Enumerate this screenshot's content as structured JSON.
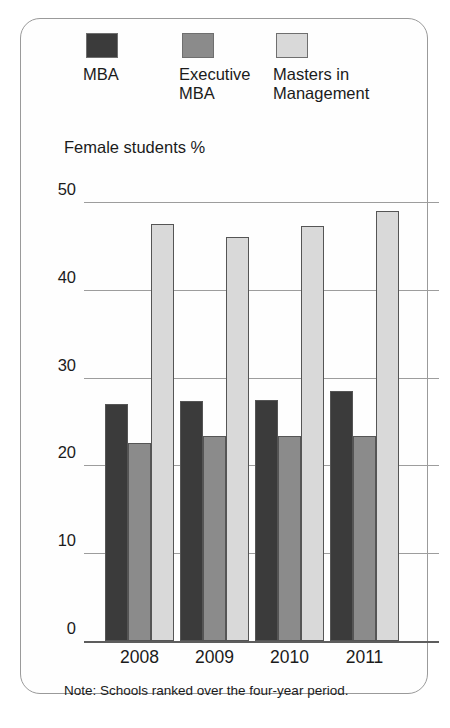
{
  "chart_data": {
    "type": "bar",
    "title": "",
    "subtitle": "",
    "ylabel": "Female students %",
    "xlabel": "",
    "categories": [
      "2008",
      "2009",
      "2010",
      "2011"
    ],
    "series": [
      {
        "name": "MBA",
        "color": "#3b3b3b",
        "values": [
          27.0,
          27.3,
          27.4,
          28.5
        ]
      },
      {
        "name": "Executive\nMBA",
        "color": "#8b8b8b",
        "values": [
          22.5,
          23.3,
          23.4,
          23.3
        ]
      },
      {
        "name": "Masters in\nManagement",
        "color": "#d9d9d9",
        "values": [
          47.5,
          46.0,
          47.3,
          49.0
        ]
      }
    ],
    "ylim": [
      0,
      50
    ],
    "yticks": [
      "0",
      "10",
      "20",
      "30",
      "40",
      "50"
    ],
    "ytick_values": [
      0,
      10,
      20,
      30,
      40,
      50
    ],
    "grid": true,
    "legend_position": "top",
    "note": "Note: Schools ranked over the four-year period."
  },
  "legend": {
    "items": [
      {
        "label": "MBA",
        "color": "#3b3b3b"
      },
      {
        "label": "Executive\nMBA",
        "color": "#8b8b8b"
      },
      {
        "label": "Masters in\nManagement",
        "color": "#d9d9d9"
      }
    ]
  },
  "axis": {
    "title": "Female students %"
  },
  "footer": {
    "note": "Note: Schools ranked over the four-year period."
  }
}
